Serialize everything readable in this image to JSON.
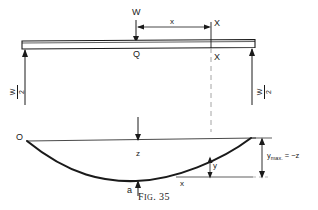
{
  "figure": {
    "caption_prefix": "F",
    "caption_rest": "IG",
    "caption_number": ". 35",
    "caption_full": "FIG. 35",
    "stroke_color": "#1a1a1a",
    "background_color": "#ffffff"
  },
  "beam_diagram": {
    "load_label": "W",
    "center_point_label": "Q",
    "distance_label": "x",
    "section_marker_top": "X",
    "section_marker_bottom": "X",
    "reaction_left": {
      "numerator": "W",
      "denominator": "2",
      "text": "W/2"
    },
    "reaction_right": {
      "numerator": "W",
      "denominator": "2",
      "text": "W/2"
    }
  },
  "deflection_diagram": {
    "origin_label": "O",
    "center_ordinate_label": "z",
    "lowest_point_label": "a",
    "ordinate_label": "y",
    "abscissa_label": "x",
    "max_deflection": {
      "symbol": "y",
      "subscript": "max.",
      "relation": " = −z",
      "text": "ymax. = −z"
    }
  }
}
